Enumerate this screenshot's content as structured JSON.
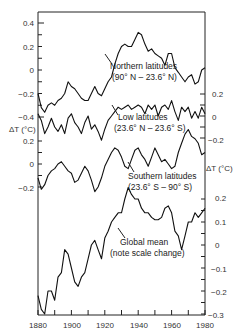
{
  "chart_data": {
    "type": "line",
    "title": "",
    "xlabel": "",
    "x_ticks": [
      "1880",
      "1900",
      "1920",
      "1940",
      "1960",
      "1980"
    ],
    "xlim": [
      1880,
      1980
    ],
    "ylabel": "ΔT (°C)",
    "series": [
      {
        "name": "Northern latitudes",
        "label_line1": "Northern latitudes",
        "label_line2": "(90° N – 23.6° N)",
        "axis": "left",
        "y_ticks": [
          "0.4",
          "0.2",
          "0",
          "−0.2",
          "−0.4"
        ],
        "x": [
          1880,
          1882,
          1884,
          1886,
          1888,
          1890,
          1892,
          1894,
          1896,
          1898,
          1900,
          1902,
          1904,
          1906,
          1908,
          1910,
          1912,
          1914,
          1916,
          1918,
          1920,
          1922,
          1924,
          1926,
          1928,
          1930,
          1932,
          1934,
          1936,
          1938,
          1940,
          1942,
          1944,
          1946,
          1948,
          1950,
          1952,
          1954,
          1956,
          1958,
          1960,
          1962,
          1964,
          1966,
          1968,
          1970,
          1972,
          1974,
          1976,
          1978,
          1980
        ],
        "values": [
          -0.2,
          -0.32,
          -0.36,
          -0.3,
          -0.28,
          -0.3,
          -0.26,
          -0.24,
          -0.2,
          -0.1,
          -0.14,
          -0.16,
          -0.2,
          -0.24,
          -0.26,
          -0.26,
          -0.2,
          -0.14,
          -0.2,
          -0.22,
          -0.16,
          -0.1,
          -0.06,
          0.05,
          0.14,
          0.2,
          0.22,
          0.2,
          0.2,
          0.26,
          0.32,
          0.3,
          0.22,
          0.16,
          0.18,
          0.14,
          0.12,
          0.1,
          0.04,
          0.14,
          0.14,
          0.02,
          -0.02,
          -0.06,
          -0.1,
          -0.06,
          -0.04,
          -0.12,
          -0.1,
          0.0,
          0.02
        ]
      },
      {
        "name": "Low latitudes",
        "label_line1": "Low latitudes",
        "label_line2": "(23.6° N – 23.6° S)",
        "axis": "right",
        "y_ticks": [
          "0.2",
          "0",
          "−0.2"
        ],
        "x": [
          1880,
          1882,
          1884,
          1886,
          1888,
          1890,
          1892,
          1894,
          1896,
          1898,
          1900,
          1902,
          1904,
          1906,
          1908,
          1910,
          1912,
          1914,
          1916,
          1918,
          1920,
          1922,
          1924,
          1926,
          1928,
          1930,
          1932,
          1934,
          1936,
          1938,
          1940,
          1942,
          1944,
          1946,
          1948,
          1950,
          1952,
          1954,
          1956,
          1958,
          1960,
          1962,
          1964,
          1966,
          1968,
          1970,
          1972,
          1974,
          1976,
          1978,
          1980
        ],
        "values": [
          0.02,
          -0.04,
          -0.16,
          -0.1,
          -0.02,
          -0.1,
          -0.14,
          -0.08,
          -0.16,
          -0.02,
          0.02,
          -0.06,
          -0.1,
          -0.16,
          -0.06,
          0.0,
          -0.12,
          -0.08,
          -0.14,
          -0.22,
          -0.12,
          -0.04,
          0.0,
          0.04,
          0.08,
          0.06,
          0.08,
          0.1,
          0.06,
          0.08,
          0.1,
          0.08,
          0.02,
          0.1,
          0.06,
          0.1,
          0.0,
          0.08,
          0.1,
          0.06,
          0.14,
          0.04,
          -0.04,
          0.08,
          0.04,
          0.08,
          -0.02,
          0.04,
          -0.02,
          0.08,
          0.02
        ]
      },
      {
        "name": "Southern latitudes",
        "label_line1": "Southern latitudes",
        "label_line2": "(23.6° S – 90° S)",
        "axis": "left",
        "y_ticks": [
          "0.2",
          "0",
          "−0.2"
        ],
        "x": [
          1880,
          1882,
          1884,
          1886,
          1888,
          1890,
          1892,
          1894,
          1896,
          1898,
          1900,
          1902,
          1904,
          1906,
          1908,
          1910,
          1912,
          1914,
          1916,
          1918,
          1920,
          1922,
          1924,
          1926,
          1928,
          1930,
          1932,
          1934,
          1936,
          1938,
          1940,
          1942,
          1944,
          1946,
          1948,
          1950,
          1952,
          1954,
          1956,
          1958,
          1960,
          1962,
          1964,
          1966,
          1968,
          1970,
          1972,
          1974,
          1976,
          1978,
          1980
        ],
        "values": [
          -0.12,
          -0.22,
          -0.18,
          -0.1,
          -0.06,
          -0.04,
          0.0,
          0.02,
          -0.02,
          -0.06,
          -0.08,
          -0.16,
          -0.14,
          -0.08,
          -0.02,
          -0.06,
          -0.14,
          -0.24,
          -0.2,
          -0.12,
          -0.02,
          0.04,
          0.1,
          0.14,
          0.12,
          0.06,
          -0.02,
          -0.04,
          0.04,
          0.12,
          0.14,
          0.08,
          0.04,
          -0.02,
          0.06,
          0.14,
          0.08,
          0.02,
          0.04,
          0.0,
          -0.04,
          -0.02,
          0.1,
          0.18,
          0.26,
          0.3,
          0.24,
          0.22,
          0.18,
          0.08,
          0.1
        ]
      },
      {
        "name": "Global mean",
        "label_line1": "Global mean",
        "label_line2": "(note scale change)",
        "axis": "right",
        "y_ticks": [
          "0.2",
          "0.1",
          "0",
          "−0.1",
          "−0.2",
          "−0.3"
        ],
        "x": [
          1880,
          1882,
          1884,
          1886,
          1888,
          1890,
          1892,
          1894,
          1896,
          1898,
          1900,
          1902,
          1904,
          1906,
          1908,
          1910,
          1912,
          1914,
          1916,
          1918,
          1920,
          1922,
          1924,
          1926,
          1928,
          1930,
          1932,
          1934,
          1936,
          1938,
          1940,
          1942,
          1944,
          1946,
          1948,
          1950,
          1952,
          1954,
          1956,
          1958,
          1960,
          1962,
          1964,
          1966,
          1968,
          1970,
          1972,
          1974,
          1976,
          1978,
          1980
        ],
        "values": [
          -0.22,
          -0.28,
          -0.3,
          -0.2,
          -0.2,
          -0.24,
          -0.14,
          -0.12,
          -0.02,
          -0.04,
          -0.1,
          -0.16,
          -0.18,
          -0.14,
          -0.12,
          -0.06,
          0.0,
          0.02,
          -0.02,
          -0.06,
          0.03,
          0.06,
          0.1,
          0.12,
          0.14,
          0.14,
          0.2,
          0.25,
          0.22,
          0.2,
          0.2,
          0.16,
          0.14,
          0.14,
          0.12,
          0.11,
          0.11,
          0.12,
          0.16,
          0.17,
          0.14,
          0.06,
          0.04,
          -0.02,
          0.04,
          0.1,
          0.1,
          0.14,
          0.12,
          0.14,
          0.16
        ]
      }
    ]
  },
  "labels": {
    "northern_1": "Northern latitudes",
    "northern_2": "(90° N – 23.6° N)",
    "low_1": "Low latitudes",
    "low_2": "(23.6° N – 23.6° S)",
    "southern_1": "Southern latitudes",
    "southern_2": "(23.6° S – 90° S)",
    "global_1": "Global mean",
    "global_2": "(note scale change)",
    "dt_left": "ΔT (°C)",
    "dt_right": "ΔT (°C)"
  },
  "axes": {
    "left_north": [
      "0.4",
      "0.2",
      "0",
      "−0.2",
      "−0.4"
    ],
    "left_south": [
      "0.2",
      "0",
      "−0.2"
    ],
    "right_low": [
      "0.2",
      "0",
      "−0.2"
    ],
    "right_global": [
      "0.2",
      "0.1",
      "0",
      "−0.1",
      "−0.2",
      "−0.3"
    ],
    "x": [
      "1880",
      "1900",
      "1920",
      "1940",
      "1960",
      "1980"
    ]
  }
}
